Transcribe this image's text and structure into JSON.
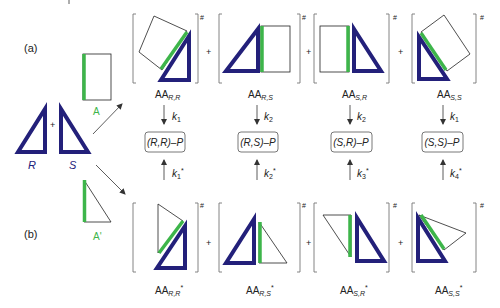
{
  "panel_labels": {
    "a": "(a)",
    "b": "(b)"
  },
  "monomers": {
    "R": "R",
    "S": "S",
    "plus": "+",
    "A": "A",
    "A_prime": "A'"
  },
  "row_a": {
    "complexes": [
      {
        "base": "AA",
        "sub": "R,R",
        "rate": "k",
        "rate_sub": "1",
        "product": "(R,R)–P"
      },
      {
        "base": "AA",
        "sub": "R,S",
        "rate": "k",
        "rate_sub": "2",
        "product": "(R,S)–P"
      },
      {
        "base": "AA",
        "sub": "S,R",
        "rate": "k",
        "rate_sub": "2",
        "product": "(S,R)–P"
      },
      {
        "base": "AA",
        "sub": "S,S",
        "rate": "k",
        "rate_sub": "1",
        "product": "(S,S)–P"
      }
    ],
    "sup": "#",
    "plus": "+"
  },
  "row_b": {
    "complexes": [
      {
        "base": "AA",
        "sub": "R,R",
        "star": "*",
        "rate": "k",
        "rate_sub": "1",
        "rate_star": "*"
      },
      {
        "base": "AA",
        "sub": "R,S",
        "star": "*",
        "rate": "k",
        "rate_sub": "2",
        "rate_star": "*"
      },
      {
        "base": "AA",
        "sub": "S,R",
        "star": "*",
        "rate": "k",
        "rate_sub": "3",
        "rate_star": "*"
      },
      {
        "base": "AA",
        "sub": "S,S",
        "star": "*",
        "rate": "k",
        "rate_sub": "4",
        "rate_star": "*"
      }
    ],
    "sup": "#",
    "plus": "+"
  },
  "colors": {
    "navy": "#23207a",
    "green": "#3db54a",
    "line": "#222222",
    "bracket": "#777777"
  }
}
